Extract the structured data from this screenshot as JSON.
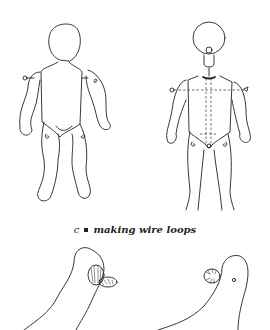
{
  "figure": {
    "caption": {
      "letter": "c",
      "text": "making wire loops"
    },
    "panels": [
      {
        "id": "doll-body-left",
        "description": "Doll body outline with wire loops marked at shoulders and hips"
      },
      {
        "id": "doll-body-right",
        "description": "Doll body with dashed wire paths through torso, neck and head"
      },
      {
        "id": "limb-loop-left",
        "description": "Arm limb with wire loop coiled at top"
      },
      {
        "id": "limb-loop-right",
        "description": "Arm limb with coiled wire loop and hole"
      }
    ]
  }
}
